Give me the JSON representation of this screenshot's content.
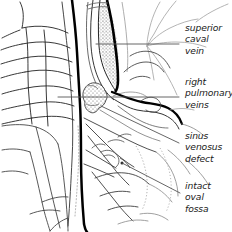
{
  "figure": {
    "background_color": "#ffffff",
    "ink_color": "#111111",
    "light_ink_color": "#9a9a9a",
    "stipple_color": "#6b6b6b",
    "leader_color": "#4a4a4a",
    "width": 232,
    "height": 232
  },
  "labels": [
    {
      "id": "superior-caval-vein",
      "lines": [
        "superior",
        "caval",
        "vein"
      ],
      "x": 185,
      "y": 22,
      "leader": {
        "type": "straight",
        "x1": 96,
        "y1": 44,
        "x2": 179,
        "y2": 44
      }
    },
    {
      "id": "right-pulmonary-veins",
      "lines": [
        "right",
        "pulmonary",
        "veins"
      ],
      "x": 185,
      "y": 76,
      "leader": {
        "type": "straight",
        "x1": 58,
        "y1": 97,
        "x2": 179,
        "y2": 97
      }
    },
    {
      "id": "sinus-venosus-defect",
      "lines": [
        "sinus",
        "venosus",
        "defect"
      ],
      "x": 185,
      "y": 130,
      "leader": {
        "type": "straight",
        "x1": 101,
        "y1": 106,
        "x2": 179,
        "y2": 143
      }
    },
    {
      "id": "intact-oval-fossa",
      "lines": [
        "intact",
        "oval",
        "fossa"
      ],
      "x": 185,
      "y": 180,
      "leader": {
        "type": "straight",
        "x1": 122,
        "y1": 163,
        "x2": 180,
        "y2": 193
      }
    }
  ],
  "structures": [
    {
      "id": "vertebral-column",
      "label": "vertebral bodies",
      "region": "left"
    },
    {
      "id": "descending-vessel",
      "label": "descending caval vessel",
      "region": "center"
    },
    {
      "id": "superior-caval-vein-shape",
      "label": "superior caval vein",
      "region": "upper-center-right",
      "shading": "stipple"
    },
    {
      "id": "sinus-venosus-defect-shape",
      "label": "sinus venosus defect",
      "region": "mid-center",
      "shading": "stipple"
    },
    {
      "id": "right-pulmonary-veins-shape",
      "label": "right pulmonary veins",
      "region": "mid-right"
    },
    {
      "id": "oval-fossa-shape",
      "label": "intact oval fossa",
      "region": "lower-center"
    },
    {
      "id": "atrial-wall",
      "label": "right atrial wall",
      "region": "lower"
    }
  ]
}
